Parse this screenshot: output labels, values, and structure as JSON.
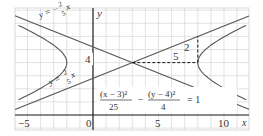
{
  "figure": {
    "axis_labels": {
      "x": "x",
      "y": "y"
    },
    "ticks": {
      "x": [
        "−5",
        "0",
        "5",
        "10"
      ],
      "y": [
        "4"
      ]
    },
    "asymptote_upper": {
      "lhs": "y = −",
      "num": "2",
      "den": "5",
      "var": "x"
    },
    "asymptote_lower": {
      "lhs": "y = ",
      "num": "2",
      "den": "5",
      "var": "x"
    },
    "triangle_labels": {
      "run": "5",
      "rise": "2"
    },
    "equation": {
      "term1_num": "(x − 3)²",
      "term1_den": "25",
      "minus": "−",
      "term2_num": "(y − 4)²",
      "term2_den": "4",
      "rhs": "= 1"
    },
    "center": [
      3,
      4
    ],
    "a": 5,
    "b": 2,
    "colors": {
      "grid": "#cfcfcf",
      "axis": "#222222",
      "curve": "#555555",
      "line": "#555555"
    }
  }
}
